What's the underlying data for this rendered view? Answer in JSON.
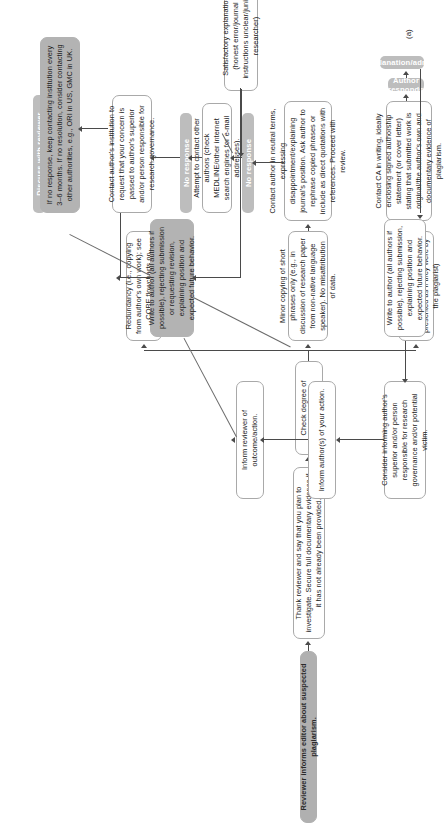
{
  "figure": {
    "label": "(a)"
  },
  "colors": {
    "box_fill": "#ffffff",
    "box_border": "#a9a9a9",
    "grey_fill": "#bdbdbd",
    "grey_dark_fill": "#b3b3b3",
    "grey_text": "#ffffff",
    "body_text": "#1b1b1b",
    "connector": "#4a4a4a"
  },
  "nodes": {
    "start": "Reviewer informs editor about suspected plagiarism.",
    "thank_reviewer": "Thank reviewer and say that you plan to investigate. Secure full documentary evidence if it has not already been provided.",
    "check_degree": "Check degree of copying.",
    "redundancy": "Redundancy (i.e., copying from author's own work); see COPE flowcharts on redundant publication.",
    "minor_copying": "Minor copying of short phrases only (e.g., in discussion of research paper from non-native language speaker). No misattribution of data.",
    "clear_plagiarism": "Clear plagiarism (unattributed use of large portions of text and/or data, presented as if they were by the plagiarist)",
    "contact_author_neutral": "Contact author in neutral terms, expressing disappointment/explaining journal's position. Ask author to rephrase copied phrases or include as direct quotations with references. Proceed with review.",
    "contact_ca": "Contact CA in writing, ideally enclosing signed authorship statement (or cover letter) stating that submitted work is original/the author's own and documentary evidence of plagiarism.",
    "attempt_other_authors": "Attempt to contact other authors (check MEDLINE/other internet search engines for e-mail addresses).",
    "contact_institution": "Contact author's institution to request that your concern is passed to author's superior and/or person responsible for research governance.",
    "no_response_keep": "If no response, keep contacting institution every 3–6 months. If no resolution, consider contacting other authorities, e.g., ORI in US, GMC in UK.",
    "satisfactory_explanation": "Satisfactory explanation (honest error/journal instructions unclear/junior researcher)",
    "write_author_reject_revision": "Write to author (all authors if possible), rejecting submission or requesting revision, explaining position and expected future behavior.",
    "write_author_reject": "Write to author (all authors if possible), rejecting submission, explaining position and expected future behavior.",
    "consider_informing": "Consider informing author's superior and/or person responsible for research governance and/or potential victim.",
    "inform_authors": "Inform author(s) of your action.",
    "inform_reviewer": "Inform reviewer of outcome/action."
  },
  "bars": {
    "no_problem": "No problem",
    "discuss_with_reviewer": "Discuss with reviewer",
    "author_responds": "Author responds",
    "unsatisfactory": "Unsatisfactory explanation/admits guilt",
    "no_response_1": "No response",
    "no_response_2": "No response"
  }
}
